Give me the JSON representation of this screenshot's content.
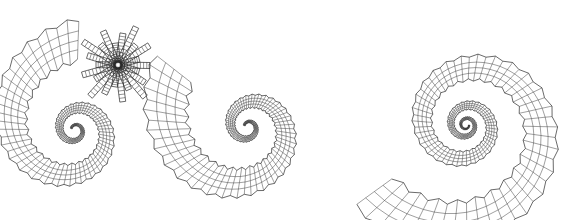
{
  "figure": {
    "background": "#ffffff",
    "line_color": "#2a2a2a",
    "panels": [
      {
        "id": "shell-with-spikes",
        "center": [
          75,
          130
        ],
        "turns": 2.2,
        "start_angle": 200,
        "r_start": 4,
        "growth": 0.225,
        "tube_ratio": 0.42,
        "segments": 130,
        "rings": 4,
        "spikes": {
          "center": [
            118,
            65
          ],
          "count": 22,
          "length_min": 22,
          "length_max": 42,
          "width": 6
        }
      },
      {
        "id": "shell-open-whorl",
        "center": [
          248,
          127
        ],
        "turns": 2.05,
        "start_angle": 200,
        "r_start": 4,
        "growth": 0.245,
        "tube_ratio": 0.45,
        "segments": 130,
        "rings": 4
      },
      {
        "id": "shell-planispiral",
        "center": [
          466,
          125
        ],
        "turns": 3.4,
        "start_angle": 0,
        "r_start": 3,
        "growth": 0.17,
        "tube_ratio": 0.38,
        "segments": 180,
        "rings": 4
      }
    ]
  }
}
